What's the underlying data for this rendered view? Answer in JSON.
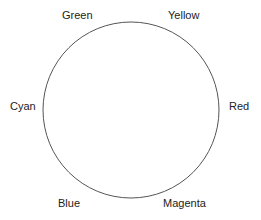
{
  "diagram": {
    "circle": {
      "cx": 131,
      "cy": 110,
      "r": 88,
      "stroke": "#555555"
    },
    "labels": [
      {
        "text": "Green",
        "x": 62,
        "y": 9
      },
      {
        "text": "Yellow",
        "x": 168,
        "y": 9
      },
      {
        "text": "Cyan",
        "x": 10,
        "y": 100
      },
      {
        "text": "Red",
        "x": 229,
        "y": 100
      },
      {
        "text": "Blue",
        "x": 58,
        "y": 197
      },
      {
        "text": "Magenta",
        "x": 163,
        "y": 197
      }
    ]
  }
}
